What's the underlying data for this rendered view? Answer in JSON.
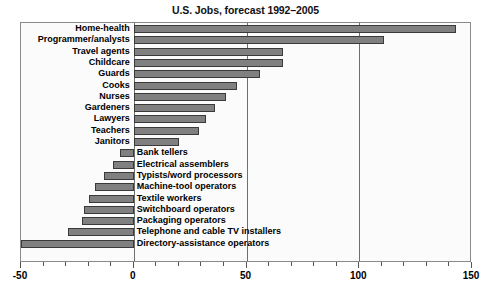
{
  "chart_data": {
    "type": "bar",
    "orientation": "horizontal",
    "title": "U.S. Jobs, forecast 1992–2005",
    "xlabel": "",
    "ylabel": "",
    "xlim": [
      -50,
      150
    ],
    "xticks": [
      -50,
      0,
      50,
      100,
      150
    ],
    "xtick_labels": [
      "-50",
      "0",
      "50",
      "100",
      "150"
    ],
    "minor_tick_step": 10,
    "grid": true,
    "gridlines_at": [
      0,
      50,
      100
    ],
    "legend": null,
    "bar_color": "#808080",
    "bar_edge_color": "#3a3a3a",
    "plot_background": "#fbfbfb",
    "frame_color": "#8a8a8a",
    "categories": [
      "Home-health",
      "Programmer/analysts",
      "Travel agents",
      "Childcare",
      "Guards",
      "Cooks",
      "Nurses",
      "Gardeners",
      "Lawyers",
      "Teachers",
      "Janitors",
      "Bank tellers",
      "Electrical assemblers",
      "Typists/word processors",
      "Machine-tool operators",
      "Textile workers",
      "Switchboard operators",
      "Packaging operators",
      "Telephone and cable TV installers",
      "Directory-assistance operators"
    ],
    "values": [
      143,
      111,
      66,
      66,
      56,
      46,
      41,
      36,
      32,
      29,
      20,
      -6,
      -9,
      -13,
      -17,
      -20,
      -22,
      -23,
      -29,
      -50
    ]
  }
}
